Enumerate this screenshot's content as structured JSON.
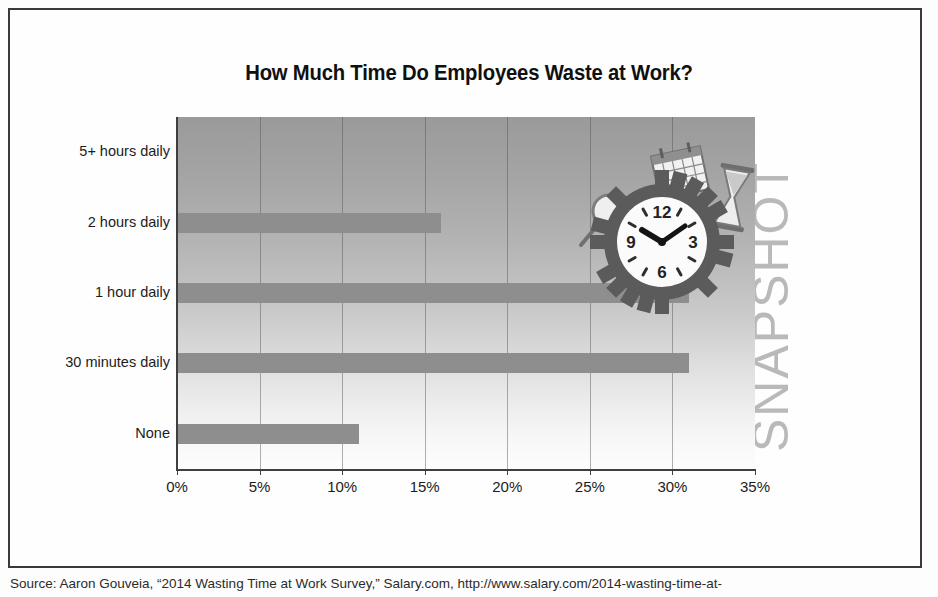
{
  "title": "How Much Time Do Employees Waste at Work?",
  "watermark": "SNAPSHOT",
  "source": "Source: Aaron Gouveia, “2014 Wasting Time at Work Survey,” Salary.com, http://www.salary.com/2014-wasting-time-at-",
  "illustration": {
    "clock_numerals": [
      "12",
      "3",
      "6",
      "9"
    ],
    "objects": [
      "gear-clock",
      "calendar",
      "hourglass",
      "magnifying-glass"
    ]
  },
  "colors": {
    "bar": "#8e8e8e",
    "axis": "#3f3f3f",
    "plot_top": "#9a9a9a",
    "plot_bottom": "#fdfdfd",
    "watermark": "#b9b9b9",
    "frame": "#3a3a3a"
  },
  "chart_data": {
    "type": "bar",
    "orientation": "horizontal",
    "title": "How Much Time Do Employees Waste at Work?",
    "xlabel": "",
    "ylabel": "",
    "categories": [
      "5+ hours daily",
      "2 hours daily",
      "1 hour daily",
      "30 minutes daily",
      "None"
    ],
    "values": [
      0,
      16,
      31,
      31,
      11
    ],
    "unit": "%",
    "xlim": [
      0,
      35
    ],
    "xticks": [
      0,
      5,
      10,
      15,
      20,
      25,
      30,
      35
    ],
    "xticklabels": [
      "0%",
      "5%",
      "10%",
      "15%",
      "20%",
      "25%",
      "30%",
      "35%"
    ],
    "grid": "vertical",
    "legend": "none",
    "series": [
      {
        "name": "Share of employees",
        "values": [
          0,
          16,
          31,
          31,
          11
        ]
      }
    ]
  }
}
